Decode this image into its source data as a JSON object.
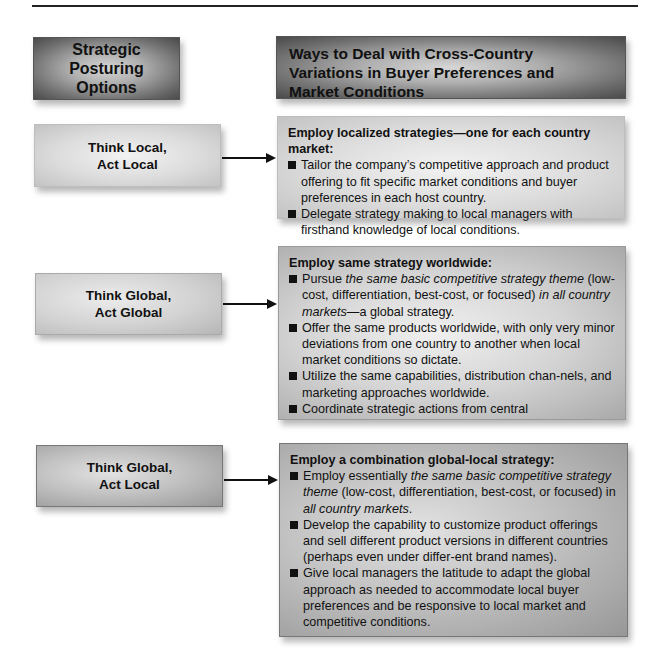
{
  "headers": {
    "left": "Strategic Posturing Options",
    "right": "Ways to Deal with Cross-Country Variations in Buyer Preferences and Market Conditions"
  },
  "options": [
    {
      "label_line1": "Think Local,",
      "label_line2": "Act Local",
      "lead": "Employ localized strategies—one for each country market:",
      "bullets": [
        {
          "parts": [
            {
              "t": "Tailor the company’s competitive approach and product offering to fit specific market conditions and buyer preferences in each host country.",
              "i": false
            }
          ]
        },
        {
          "parts": [
            {
              "t": "Delegate strategy making to local managers with firsthand knowledge of local conditions.",
              "i": false
            }
          ]
        }
      ]
    },
    {
      "label_line1": "Think Global,",
      "label_line2": "Act Global",
      "lead": "Employ same strategy worldwide:",
      "bullets": [
        {
          "parts": [
            {
              "t": "Pursue ",
              "i": false
            },
            {
              "t": "the same basic competitive strategy theme",
              "i": true
            },
            {
              "t": " (low-cost, differentiation, best-cost, or focused) ",
              "i": false
            },
            {
              "t": "in all country markets",
              "i": true
            },
            {
              "t": "—a global strategy.",
              "i": false
            }
          ]
        },
        {
          "parts": [
            {
              "t": "Offer the same products worldwide, with only very minor deviations from one country to another when local market conditions so dictate.",
              "i": false
            }
          ]
        },
        {
          "parts": [
            {
              "t": "Utilize the same capabilities, distribution chan-nels, and marketing approaches worldwide.",
              "i": false
            }
          ]
        },
        {
          "parts": [
            {
              "t": "Coordinate strategic actions from central",
              "i": false
            }
          ]
        }
      ]
    },
    {
      "label_line1": "Think Global,",
      "label_line2": "Act Local",
      "lead": "Employ a combination global-local strategy:",
      "bullets": [
        {
          "parts": [
            {
              "t": "Employ essentially ",
              "i": false
            },
            {
              "t": "the same basic competitive strategy theme",
              "i": true
            },
            {
              "t": " (low-cost, differentiation, best-cost, or focused) in ",
              "i": false
            },
            {
              "t": "all country markets",
              "i": true
            },
            {
              "t": ".",
              "i": false
            }
          ]
        },
        {
          "parts": [
            {
              "t": "Develop the capability to customize product offerings and sell different product versions in different countries (perhaps even under differ-ent brand names).",
              "i": false
            }
          ]
        },
        {
          "parts": [
            {
              "t": "Give local managers the latitude to adapt the global approach as needed to accommodate local buyer preferences and be responsive to local market and competitive conditions.",
              "i": false
            }
          ]
        }
      ]
    }
  ]
}
